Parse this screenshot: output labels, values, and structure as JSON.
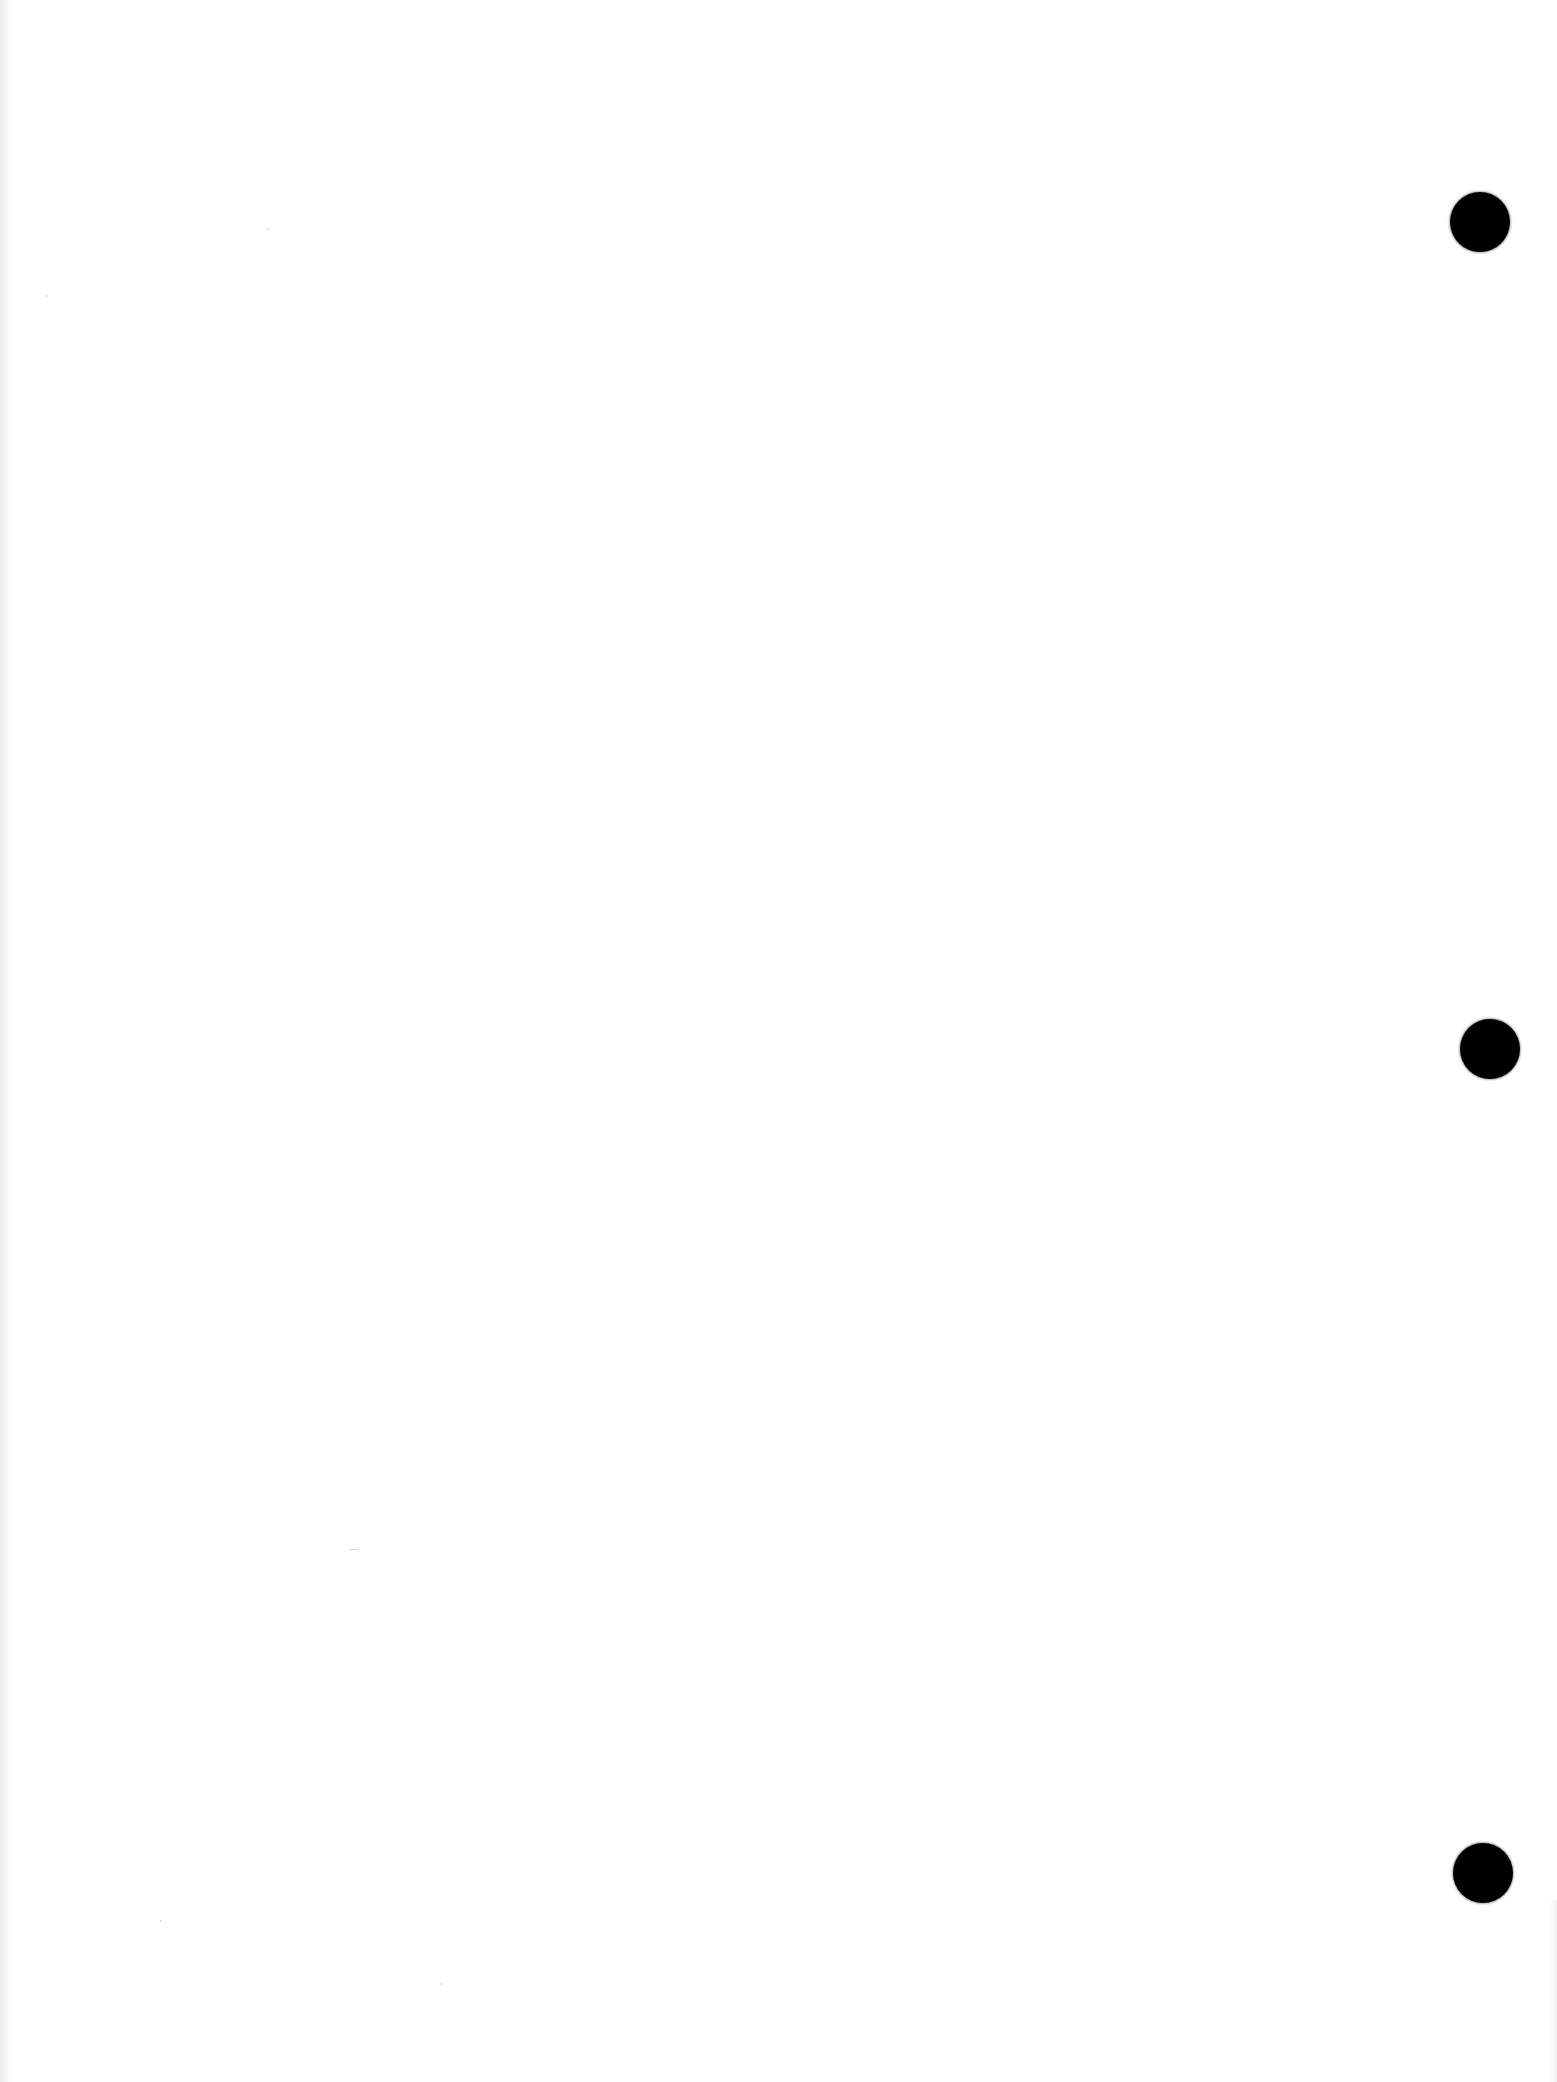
{
  "document": {
    "type": "blank scanned page",
    "background_color": "#ffffff",
    "text_content": ""
  },
  "punch_holes": [
    {
      "position": "top",
      "cx": 1480,
      "cy": 222,
      "radius": 30,
      "color": "#000000"
    },
    {
      "position": "middle",
      "cx": 1490,
      "cy": 1049,
      "radius": 30,
      "color": "#000000"
    },
    {
      "position": "bottom",
      "cx": 1483,
      "cy": 1873,
      "radius": 30,
      "color": "#000000"
    }
  ]
}
